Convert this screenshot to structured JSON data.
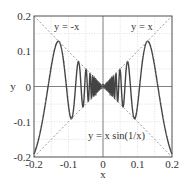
{
  "chart_data": {
    "type": "line",
    "title": "",
    "xlabel": "x",
    "ylabel": "y",
    "xlim": [
      -0.2,
      0.2
    ],
    "ylim": [
      -0.2,
      0.2
    ],
    "x_ticks": [
      "-0.2",
      "-0.1",
      "0",
      "0.1",
      "0.2"
    ],
    "y_ticks": [
      "0.2",
      "0.1",
      "0",
      "-0.1",
      "-0.2"
    ],
    "grid": true,
    "grid_step": 0.05,
    "series": [
      {
        "name": "y = x sin(1/x)",
        "style": "solid",
        "color": "#444444",
        "function": "x*sin(1/x)"
      },
      {
        "name": "y = x",
        "style": "dashed",
        "color": "#999999",
        "function": "x"
      },
      {
        "name": "y = -x",
        "style": "dashed",
        "color": "#999999",
        "function": "-x"
      }
    ],
    "annotations": [
      {
        "text": "y = -x",
        "x": -0.13,
        "y": 0.175
      },
      {
        "text": "y = x",
        "x": 0.12,
        "y": 0.175
      },
      {
        "text": "y = x sin(1/x)",
        "x": 0.07,
        "y": -0.135
      }
    ]
  }
}
